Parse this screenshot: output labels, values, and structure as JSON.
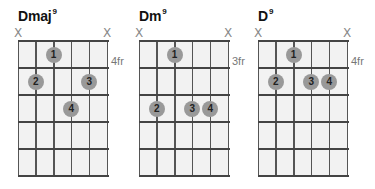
{
  "chords": [
    {
      "name": "Dmaj",
      "superscript": "9",
      "fret_label": "4fr",
      "muted_strings": [
        1,
        6
      ],
      "fingers": [
        {
          "finger": "1",
          "string": 3,
          "fret": 1
        },
        {
          "finger": "2",
          "string": 2,
          "fret": 2
        },
        {
          "finger": "3",
          "string": 5,
          "fret": 2
        },
        {
          "finger": "4",
          "string": 4,
          "fret": 3
        }
      ]
    },
    {
      "name": "Dm",
      "superscript": "9",
      "fret_label": "3fr",
      "muted_strings": [
        1,
        6
      ],
      "fingers": [
        {
          "finger": "1",
          "string": 3,
          "fret": 1
        },
        {
          "finger": "2",
          "string": 2,
          "fret": 3
        },
        {
          "finger": "3",
          "string": 4,
          "fret": 3
        },
        {
          "finger": "4",
          "string": 5,
          "fret": 3
        }
      ]
    },
    {
      "name": "D",
      "superscript": "9",
      "fret_label": "4fr",
      "muted_strings": [
        1,
        6
      ],
      "fingers": [
        {
          "finger": "1",
          "string": 3,
          "fret": 1
        },
        {
          "finger": "2",
          "string": 2,
          "fret": 2
        },
        {
          "finger": "3",
          "string": 4,
          "fret": 2
        },
        {
          "finger": "4",
          "string": 5,
          "fret": 2
        }
      ]
    }
  ],
  "mute_symbol": "X",
  "colors": {
    "dot": "#999999",
    "grid_line": "#444444",
    "grid_bg": "#f2f2f2",
    "mute": "#888888",
    "fret_label": "#777777"
  }
}
